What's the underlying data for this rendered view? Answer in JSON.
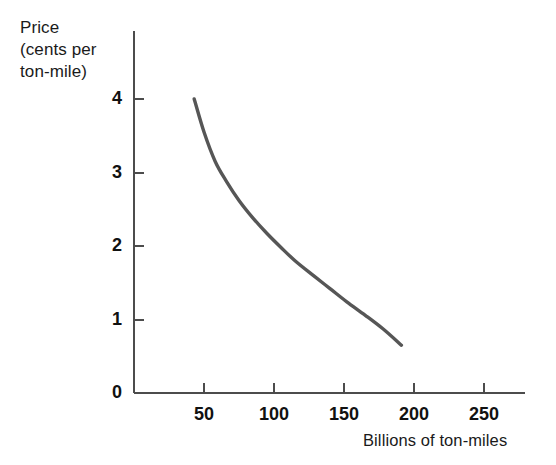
{
  "chart_data": {
    "type": "line",
    "title": "",
    "subtitle": "",
    "xlabel": "Billions of ton-miles",
    "ylabel": "Price\n(cents per\nton-mile)",
    "ylabel_lines": [
      "Price",
      "(cents per",
      "ton-mile)"
    ],
    "grid": false,
    "legend": null,
    "legend_position": "none",
    "xlim": [
      0,
      280
    ],
    "ylim": [
      0,
      4.3
    ],
    "xticks": [
      50,
      100,
      150,
      200,
      250
    ],
    "xtick_labels": [
      "50",
      "100",
      "150",
      "200",
      "250"
    ],
    "yticks": [
      0,
      1,
      2,
      3,
      4
    ],
    "ytick_labels": [
      "0",
      "1",
      "2",
      "3",
      "4"
    ],
    "x_origin_label": "0",
    "series": [
      {
        "name": "Demand curve",
        "color": "#565656",
        "line_width": 3.4,
        "points": [
          {
            "x": 43,
            "y": 4.0
          },
          {
            "x": 50,
            "y": 3.55
          },
          {
            "x": 58,
            "y": 3.15
          },
          {
            "x": 66,
            "y": 2.88
          },
          {
            "x": 75,
            "y": 2.62
          },
          {
            "x": 85,
            "y": 2.38
          },
          {
            "x": 95,
            "y": 2.17
          },
          {
            "x": 105,
            "y": 1.98
          },
          {
            "x": 115,
            "y": 1.8
          },
          {
            "x": 128,
            "y": 1.6
          },
          {
            "x": 140,
            "y": 1.42
          },
          {
            "x": 152,
            "y": 1.24
          },
          {
            "x": 165,
            "y": 1.06
          },
          {
            "x": 178,
            "y": 0.87
          },
          {
            "x": 191,
            "y": 0.65
          }
        ]
      }
    ],
    "annotations": [],
    "colors": {
      "axis": "#4c4c4c",
      "curve": "#565656",
      "text": "#1a1a1a",
      "background": "#ffffff"
    }
  },
  "layout": {
    "plot_left_px": 134,
    "plot_bottom_px": 393,
    "plot_top_px": 31,
    "plot_right_px": 525,
    "x_scale_px_per_unit": 1.4,
    "y_scale_px_per_unit": 73.5
  }
}
